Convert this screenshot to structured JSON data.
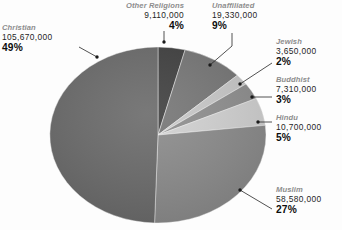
{
  "chart_data": {
    "type": "pie",
    "title": "",
    "legend_position": "external-callouts",
    "total": 214350000,
    "categories": [
      "Christian",
      "Muslim",
      "Unaffiliated",
      "Hindu",
      "Other Religions",
      "Buddhist",
      "Jewish"
    ],
    "values": [
      105670000,
      58580000,
      19330000,
      10700000,
      9110000,
      7310000,
      3650000
    ],
    "percents": [
      49,
      27,
      9,
      5,
      4,
      3,
      2
    ],
    "slices": [
      {
        "name": "Other Religions",
        "value": "9,110,000",
        "percent": "4%",
        "percent_num": 4,
        "color": "#3f3f3f"
      },
      {
        "name": "Unaffiliated",
        "value": "19,330,000",
        "percent": "9%",
        "percent_num": 9,
        "color": "#767676"
      },
      {
        "name": "Jewish",
        "value": "3,650,000",
        "percent": "2%",
        "percent_num": 2,
        "color": "#c9c9c9"
      },
      {
        "name": "Buddhist",
        "value": "7,310,000",
        "percent": "3%",
        "percent_num": 3,
        "color": "#8f8f8f"
      },
      {
        "name": "Hindu",
        "value": "10,700,000",
        "percent": "5%",
        "percent_num": 5,
        "color": "#d2d2d2"
      },
      {
        "name": "Muslim",
        "value": "58,580,000",
        "percent": "27%",
        "percent_num": 27,
        "color": "#8b8b8b"
      },
      {
        "name": "Christian",
        "value": "105,670,000",
        "percent": "49%",
        "percent_num": 49,
        "color": "#6a6a6a"
      }
    ]
  },
  "labels": {
    "other": {
      "name": "Other Religions",
      "value": "9,110,000",
      "percent": "4%"
    },
    "unaffiliated": {
      "name": "Unaffiliated",
      "value": "19,330,000",
      "percent": "9%"
    },
    "christian": {
      "name": "Christian",
      "value": "105,670,000",
      "percent": "49%"
    },
    "jewish": {
      "name": "Jewish",
      "value": "3,650,000",
      "percent": "2%"
    },
    "buddhist": {
      "name": "Buddhist",
      "value": "7,310,000",
      "percent": "3%"
    },
    "hindu": {
      "name": "Hindu",
      "value": "10,700,000",
      "percent": "5%"
    },
    "muslim": {
      "name": "Muslim",
      "value": "58,580,000",
      "percent": "27%"
    }
  }
}
